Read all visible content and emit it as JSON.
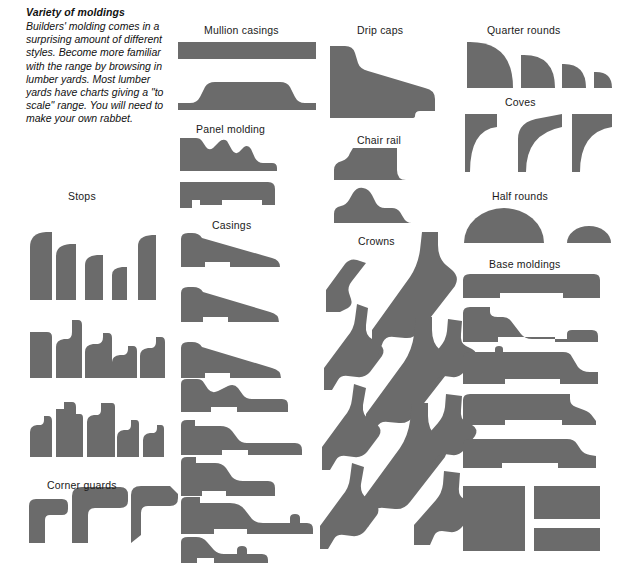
{
  "page": {
    "width": 619,
    "height": 569,
    "background": "#ffffff",
    "shape_fill": "#6b6b6b",
    "text_color": "#1a1a1a"
  },
  "intro": {
    "title": "Variety of moldings",
    "body": "Builders' molding comes in a surprising amount of different styles. Become more familiar with the range by browsing in lumber yards. Most lumber yards have charts giving a \"to scale\" range. You will need to make your own rabbet."
  },
  "captions": [
    {
      "id": "stops",
      "label": "Stops",
      "x": 68,
      "y": 190
    },
    {
      "id": "corner-guards",
      "label": "Corner guards",
      "x": 47,
      "y": 479
    },
    {
      "id": "mullion-casings",
      "label": "Mullion casings",
      "x": 204,
      "y": 24
    },
    {
      "id": "panel-molding",
      "label": "Panel molding",
      "x": 196,
      "y": 123
    },
    {
      "id": "casings",
      "label": "Casings",
      "x": 212,
      "y": 219
    },
    {
      "id": "drip-caps",
      "label": "Drip caps",
      "x": 357,
      "y": 24
    },
    {
      "id": "chair-rail",
      "label": "Chair rail",
      "x": 357,
      "y": 134
    },
    {
      "id": "crowns",
      "label": "Crowns",
      "x": 358,
      "y": 235
    },
    {
      "id": "quarter-rounds",
      "label": "Quarter rounds",
      "x": 487,
      "y": 24
    },
    {
      "id": "coves",
      "label": "Coves",
      "x": 505,
      "y": 96
    },
    {
      "id": "half-rounds",
      "label": "Half rounds",
      "x": 492,
      "y": 190
    },
    {
      "id": "base-moldings",
      "label": "Base moldings",
      "x": 489,
      "y": 258
    }
  ],
  "groups": {
    "stops": {
      "label": "Stops",
      "count": 15,
      "rows": 3,
      "description": "Three rows of five stop-molding profiles, decreasing in size."
    },
    "corner_guards": {
      "label": "Corner guards",
      "count": 3,
      "description": "Three L-shaped corner guard profiles of increasing size."
    },
    "mullion_casings": {
      "label": "Mullion casings",
      "count": 2,
      "description": "Two flat, wide mullion casing profiles."
    },
    "panel_molding": {
      "label": "Panel molding",
      "count": 2,
      "description": "Two panel molding profiles with curved upper contours."
    },
    "casings": {
      "label": "Casings",
      "count": 8,
      "description": "Eight tapered casing profiles stacked vertically."
    },
    "drip_caps": {
      "label": "Drip caps",
      "count": 1,
      "description": "One large wedge-shaped drip cap profile."
    },
    "chair_rail": {
      "label": "Chair rail",
      "count": 2,
      "description": "Two chair rail profiles with ogee tops."
    },
    "crowns": {
      "label": "Crowns",
      "count": 9,
      "description": "Nine diagonal crown molding profiles with S-curve faces."
    },
    "quarter_rounds": {
      "label": "Quarter rounds",
      "count": 4,
      "description": "Four quarter-round profiles in decreasing sizes."
    },
    "coves": {
      "label": "Coves",
      "count": 3,
      "description": "Three concave cove profiles."
    },
    "half_rounds": {
      "label": "Half rounds",
      "count": 2,
      "description": "Two half-round (half-disc) profiles, large and small."
    },
    "base_moldings": {
      "label": "Base moldings",
      "count": 8,
      "description": "Five contoured base molding profiles plus three plain rectangular stock pieces."
    }
  }
}
